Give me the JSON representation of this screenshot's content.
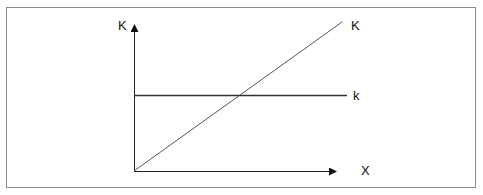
{
  "diagram": {
    "y_axis_label": "K",
    "x_axis_label": "X",
    "diagonal_line_label": "K",
    "horizontal_line_label": "k",
    "colors": {
      "frame": "#8a8a8a",
      "axes": "#222222",
      "diagonal": "#555555",
      "horizontal": "#333333"
    }
  }
}
